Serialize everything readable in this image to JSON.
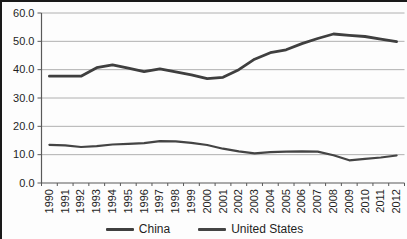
{
  "frame": {
    "border_color": "#1a1a1a",
    "background": "#fdfdfd"
  },
  "chart_data": {
    "type": "line",
    "title": "",
    "xlabel": "",
    "ylabel": "",
    "categories": [
      "1990",
      "1991",
      "1992",
      "1993",
      "1994",
      "1995",
      "1996",
      "1997",
      "1998",
      "1999",
      "2000",
      "2001",
      "2002",
      "2003",
      "2004",
      "2005",
      "2006",
      "2007",
      "2008",
      "2009",
      "2010",
      "2011",
      "2012"
    ],
    "series": [
      {
        "name": "China",
        "color": "#3f3f3f",
        "stroke_width": 2.8,
        "values": [
          37.7,
          37.7,
          37.7,
          40.7,
          41.7,
          40.5,
          39.3,
          40.3,
          39.2,
          38.2,
          36.8,
          37.3,
          40.0,
          43.7,
          46.0,
          47.0,
          49.2,
          51.0,
          52.6,
          52.1,
          51.7,
          50.8,
          49.9
        ]
      },
      {
        "name": "United States",
        "color": "#444444",
        "stroke_width": 2.2,
        "values": [
          13.5,
          13.3,
          12.7,
          13.0,
          13.6,
          13.8,
          14.1,
          14.8,
          14.7,
          14.2,
          13.4,
          12.1,
          11.2,
          10.5,
          10.9,
          11.1,
          11.2,
          11.1,
          9.8,
          8.0,
          8.5,
          9.0,
          9.7
        ]
      }
    ],
    "ylim": [
      0,
      60
    ],
    "yticks": [
      {
        "value": 60,
        "label": "60.0"
      },
      {
        "value": 50,
        "label": "50.0"
      },
      {
        "value": 40,
        "label": "40.0"
      },
      {
        "value": 30,
        "label": "30.0"
      },
      {
        "value": 20,
        "label": "20.0"
      },
      {
        "value": 10,
        "label": "10.0"
      },
      {
        "value": 0,
        "label": "0.0"
      }
    ],
    "grid": true,
    "legend_position": "bottom",
    "colors": {
      "gridline": "#b0b0b0",
      "axis": "#595959",
      "text": "#1f1f1f"
    }
  }
}
